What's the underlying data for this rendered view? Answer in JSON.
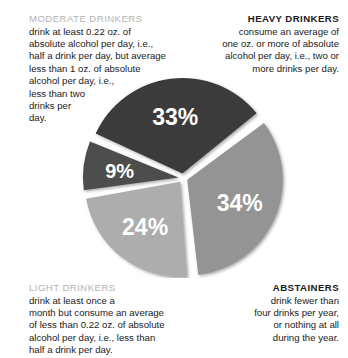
{
  "chart_data": {
    "type": "pie",
    "title": "",
    "categories": [
      "HEAVY DRINKERS",
      "ABSTAINERS",
      "LIGHT DRINKERS",
      "MODERATE DRINKERS"
    ],
    "values": [
      9,
      33,
      34,
      24
    ],
    "labels": [
      "9%",
      "33%",
      "34%",
      "24%"
    ],
    "units": "percent",
    "legend_position": "callouts-around-chart",
    "grid": false,
    "colors": [
      "#4d4d4d",
      "#3b3b3b",
      "#949494",
      "#adadad"
    ],
    "slice_gap_color": "#ffffff",
    "slices": [
      {
        "label": "9%",
        "value": 9,
        "color": "#4d4d4d",
        "category": "HEAVY DRINKERS"
      },
      {
        "label": "33%",
        "value": 33,
        "color": "#3b3b3b",
        "category": "ABSTAINERS"
      },
      {
        "label": "34%",
        "value": 34,
        "color": "#949494",
        "category": "LIGHT DRINKERS"
      },
      {
        "label": "24%",
        "value": 24,
        "color": "#adadad",
        "category": "MODERATE DRINKERS"
      }
    ]
  },
  "callouts": {
    "moderate": {
      "heading": "MODERATE DRINKERS",
      "lines": [
        "drink at least 0.22 oz. of",
        "absolute alcohol per day, i.e.,",
        "half a drink per day, but average",
        "less than 1 oz. of absolute",
        "alcohol per day, i.e.,",
        "less than two",
        "drinks per",
        "day."
      ]
    },
    "heavy": {
      "heading": "HEAVY DRINKERS",
      "lines": [
        "consume an average of",
        "one oz. or more of absolute",
        "alcohol per day, i.e., two or",
        "more drinks per day."
      ]
    },
    "light": {
      "heading": "LIGHT DRINKERS",
      "lines": [
        "drink at least once a",
        "month but consume an average",
        "of less than 0.22 oz. of absolute",
        "alcohol per day, i.e., less than",
        "half a drink per day."
      ]
    },
    "abstainers": {
      "heading": "ABSTAINERS",
      "lines": [
        "drink fewer than",
        "four drinks per year,",
        "or nothing at all",
        "during the year."
      ]
    }
  }
}
